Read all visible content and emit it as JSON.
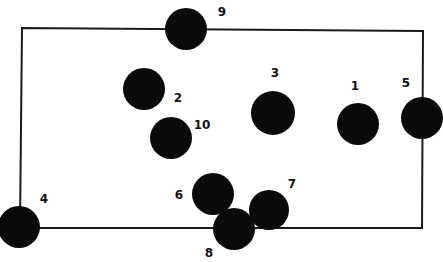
{
  "diagram": {
    "type": "node-placement-diagram",
    "colors": {
      "background": "#ffffff",
      "line": "#1a1a1a",
      "node": "#0a0a0a",
      "label": "#111111"
    },
    "rectangle": {
      "corners": [
        [
          22,
          28
        ],
        [
          423,
          31
        ],
        [
          422,
          228
        ],
        [
          20,
          228
        ]
      ]
    },
    "nodes": [
      {
        "id": "1",
        "label": "1",
        "cx": 358,
        "cy": 124,
        "r": 21,
        "lx": 355,
        "ly": 90
      },
      {
        "id": "2",
        "label": "2",
        "cx": 144,
        "cy": 89,
        "r": 21,
        "lx": 178,
        "ly": 102
      },
      {
        "id": "3",
        "label": "3",
        "cx": 273,
        "cy": 113,
        "r": 22,
        "lx": 275,
        "ly": 77
      },
      {
        "id": "4",
        "label": "4",
        "cx": 19,
        "cy": 227,
        "r": 21,
        "lx": 44,
        "ly": 203
      },
      {
        "id": "5",
        "label": "5",
        "cx": 422,
        "cy": 118,
        "r": 21,
        "lx": 406,
        "ly": 87
      },
      {
        "id": "6",
        "label": "6",
        "cx": 213,
        "cy": 194,
        "r": 21,
        "lx": 179,
        "ly": 199
      },
      {
        "id": "7",
        "label": "7",
        "cx": 269,
        "cy": 210,
        "r": 20,
        "lx": 292,
        "ly": 188
      },
      {
        "id": "8",
        "label": "8",
        "cx": 234,
        "cy": 229,
        "r": 21,
        "lx": 209,
        "ly": 257
      },
      {
        "id": "9",
        "label": "9",
        "cx": 186,
        "cy": 29,
        "r": 21,
        "lx": 222,
        "ly": 16
      },
      {
        "id": "10",
        "label": "10",
        "cx": 171,
        "cy": 138,
        "r": 21,
        "lx": 202,
        "ly": 129
      }
    ]
  }
}
